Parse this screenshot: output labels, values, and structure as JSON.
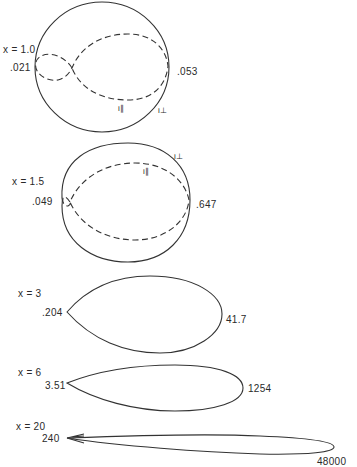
{
  "figure": {
    "legend": {
      "perpendicular": "i⊥",
      "parallel": "i∥"
    },
    "panels": [
      {
        "x_label": "x = 1.0",
        "backward_value": ".021",
        "forward_value": ".053",
        "curves": [
          "i∥",
          "i⊥"
        ]
      },
      {
        "x_label": "x = 1.5",
        "backward_value": ".049",
        "forward_value": ".647",
        "curves": [
          "i⊥",
          "i∥"
        ]
      },
      {
        "x_label": "x = 3",
        "backward_value": ".204",
        "forward_value": "41.7"
      },
      {
        "x_label": "x = 6",
        "backward_value": "3.51",
        "forward_value": "1254"
      },
      {
        "x_label": "x = 20",
        "backward_value": "240",
        "forward_value": "48000"
      }
    ]
  }
}
